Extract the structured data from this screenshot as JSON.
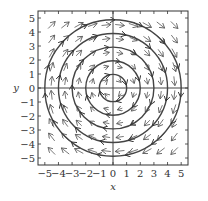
{
  "chart_data": {
    "type": "vector_field",
    "title": "",
    "xlabel": "x",
    "ylabel": "y",
    "xlim": [
      -5.5,
      5.5
    ],
    "ylim": [
      -5.5,
      5.5
    ],
    "xticks": [
      -5,
      -4,
      -3,
      -2,
      -1,
      0,
      1,
      2,
      3,
      4,
      5
    ],
    "yticks": [
      -5,
      -4,
      -3,
      -2,
      -1,
      0,
      1,
      2,
      3,
      4,
      5
    ],
    "xtick_labels": [
      "−5",
      "−4",
      "−3",
      "−2",
      "−1",
      "0",
      "1",
      "2",
      "3",
      "4",
      "5"
    ],
    "ytick_labels": [
      "−5",
      "−4",
      "−3",
      "−2",
      "−1",
      "0",
      "1",
      "2",
      "3",
      "4",
      "5"
    ],
    "field": {
      "u": "y",
      "v": "-x",
      "description": "F(x, y) = (y, -x), clockwise rotation"
    },
    "arrow_grid": {
      "start": -4.5,
      "end": 4.5,
      "step": 1
    },
    "flow_lines": [
      {
        "type": "circle",
        "radius": 1,
        "direction": "clockwise"
      },
      {
        "type": "circle",
        "radius": 2,
        "direction": "clockwise"
      },
      {
        "type": "circle",
        "radius": 3,
        "direction": "clockwise"
      },
      {
        "type": "circle",
        "radius": 4,
        "direction": "clockwise"
      },
      {
        "type": "circle",
        "radius": 5,
        "direction": "clockwise"
      }
    ],
    "axes_lines": {
      "x_axis": true,
      "y_axis": true
    },
    "grid": false,
    "legend": null
  },
  "style": {
    "line_color": "#444444",
    "arrow_color": "#555555",
    "frame_color": "#333333"
  }
}
